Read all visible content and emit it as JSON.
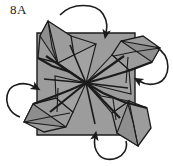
{
  "figure": {
    "step_label": "8A",
    "title": "8A",
    "kind": "origami-diagram",
    "background_color": "#ffffff",
    "paper_fill": "#9c9c9c",
    "paper_fill_shaded": "#8e8e8e",
    "paper_fill_light": "#a8a8a8",
    "line_color": "#1b1b1b",
    "label_color": "#1a1a1a"
  },
  "base": {
    "name": "square-base",
    "description": "flat gray square sheet seen from above",
    "corners": [
      [
        37,
        33
      ],
      [
        135,
        33
      ],
      [
        135,
        135
      ],
      [
        37,
        135
      ]
    ]
  },
  "center": {
    "name": "center-point",
    "x": 86,
    "y": 83,
    "crease_count": 8
  },
  "flaps": [
    {
      "id": "top-left-flap",
      "label": "top left point",
      "tip": [
        48,
        21
      ]
    },
    {
      "id": "top-right-flap",
      "label": "top right point",
      "tip": [
        160,
        48
      ]
    },
    {
      "id": "bottom-right-flap",
      "label": "bottom right point",
      "tip": [
        138,
        146
      ]
    },
    {
      "id": "bottom-left-flap",
      "label": "bottom left point",
      "tip": [
        24,
        122
      ]
    }
  ],
  "arrows": [
    {
      "id": "arrow-top",
      "name": "fold-arrow-top",
      "direction": "down-right",
      "description": "curved arrow over the top edge pointing down"
    },
    {
      "id": "arrow-right",
      "name": "fold-arrow-right",
      "direction": "left",
      "description": "curved arrow at the right side pointing left"
    },
    {
      "id": "arrow-bottom",
      "name": "fold-arrow-bottom",
      "direction": "up",
      "description": "curved arrow under the bottom edge pointing up"
    },
    {
      "id": "arrow-left",
      "name": "fold-arrow-left",
      "direction": "right",
      "description": "curved arrow at the left side pointing right"
    }
  ]
}
